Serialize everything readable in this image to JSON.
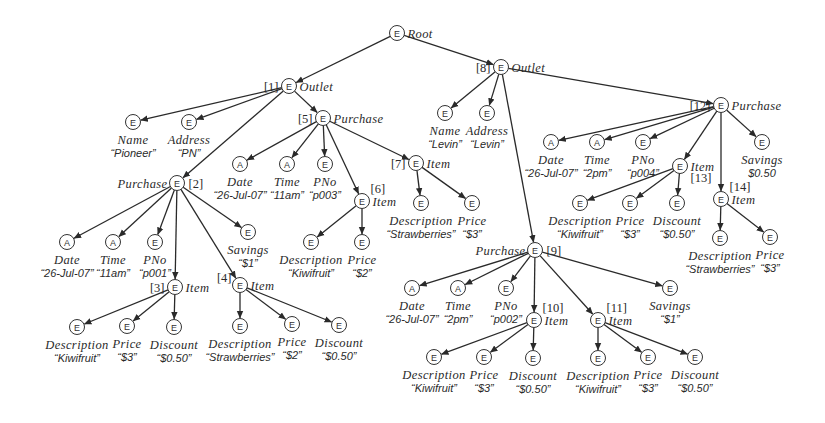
{
  "diagram": {
    "colors": {
      "ink": "#2a2a2a",
      "background": "#ffffff"
    },
    "node_types": {
      "E": "element",
      "A": "attribute"
    },
    "nodes": [
      {
        "key": "root",
        "type": "E",
        "x": 397,
        "y": 33,
        "label": "Root",
        "label_pos": "right"
      },
      {
        "key": "n1",
        "type": "E",
        "x": 289,
        "y": 86,
        "label": "Outlet",
        "label_pos": "right",
        "id": "[1]",
        "id_pos": "left"
      },
      {
        "key": "n1_name",
        "type": "E",
        "x": 133,
        "y": 122,
        "label": "Name",
        "value": "“Pioneer”",
        "label_pos": "below"
      },
      {
        "key": "n1_addr",
        "type": "E",
        "x": 189,
        "y": 122,
        "label": "Address",
        "value": "“PN”",
        "label_pos": "below"
      },
      {
        "key": "n2",
        "type": "E",
        "x": 177,
        "y": 183,
        "label": "Purchase",
        "label_pos": "left",
        "id": "[2]",
        "id_pos": "right"
      },
      {
        "key": "n2_date",
        "type": "A",
        "x": 67,
        "y": 242,
        "label": "Date",
        "value": "“26-Jul-07”",
        "label_pos": "below"
      },
      {
        "key": "n2_time",
        "type": "A",
        "x": 113,
        "y": 242,
        "label": "Time",
        "value": "“11am”",
        "label_pos": "below"
      },
      {
        "key": "n2_pno",
        "type": "E",
        "x": 155,
        "y": 242,
        "label": "PNo",
        "value": "“p001”",
        "label_pos": "below"
      },
      {
        "key": "n2_sav",
        "type": "E",
        "x": 248,
        "y": 232,
        "label": "Savings",
        "value": "“$1”",
        "label_pos": "below"
      },
      {
        "key": "n3",
        "type": "E",
        "x": 175,
        "y": 287,
        "label": "Item",
        "label_pos": "right",
        "id": "[3]",
        "id_pos": "left"
      },
      {
        "key": "n3_desc",
        "type": "E",
        "x": 77,
        "y": 327,
        "label": "Description",
        "value": "“Kiwifruit”",
        "label_pos": "below"
      },
      {
        "key": "n3_price",
        "type": "E",
        "x": 127,
        "y": 326,
        "label": "Price",
        "value": "“$3”",
        "label_pos": "below"
      },
      {
        "key": "n3_disc",
        "type": "E",
        "x": 174,
        "y": 327,
        "label": "Discount",
        "value": "“$0.50”",
        "label_pos": "below"
      },
      {
        "key": "n4",
        "type": "E",
        "x": 240,
        "y": 285,
        "label": "Item",
        "label_pos": "right",
        "id": "[4]",
        "id_pos": "topleft"
      },
      {
        "key": "n4_desc",
        "type": "E",
        "x": 240,
        "y": 326,
        "label": "Description",
        "value": "“Strawberries”",
        "label_pos": "below"
      },
      {
        "key": "n4_price",
        "type": "E",
        "x": 292,
        "y": 324,
        "label": "Price",
        "value": "“$2”",
        "label_pos": "below"
      },
      {
        "key": "n4_disc",
        "type": "E",
        "x": 339,
        "y": 325,
        "label": "Discount",
        "value": "“$0.50”",
        "label_pos": "below"
      },
      {
        "key": "n5",
        "type": "E",
        "x": 323,
        "y": 118,
        "label": "Purchase",
        "label_pos": "right",
        "id": "[5]",
        "id_pos": "left"
      },
      {
        "key": "n5_date",
        "type": "A",
        "x": 240,
        "y": 164,
        "label": "Date",
        "value": "“26-Jul-07”",
        "label_pos": "below"
      },
      {
        "key": "n5_time",
        "type": "A",
        "x": 287,
        "y": 164,
        "label": "Time",
        "value": "“11am”",
        "label_pos": "below"
      },
      {
        "key": "n5_pno",
        "type": "E",
        "x": 325,
        "y": 164,
        "label": "PNo",
        "value": "“p003”",
        "label_pos": "below"
      },
      {
        "key": "n6",
        "type": "E",
        "x": 362,
        "y": 201,
        "label": "Item",
        "label_pos": "right",
        "id": "[6]",
        "id_pos": "topright"
      },
      {
        "key": "n6_desc",
        "type": "E",
        "x": 311,
        "y": 242,
        "label": "Description",
        "value": "“Kiwifruit”",
        "label_pos": "below"
      },
      {
        "key": "n6_price",
        "type": "E",
        "x": 362,
        "y": 242,
        "label": "Price",
        "value": "“$2”",
        "label_pos": "below"
      },
      {
        "key": "n7",
        "type": "E",
        "x": 416,
        "y": 163,
        "label": "Item",
        "label_pos": "right",
        "id": "[7]",
        "id_pos": "left"
      },
      {
        "key": "n7_desc",
        "type": "E",
        "x": 421,
        "y": 203,
        "label": "Description",
        "value": "“Strawberries”",
        "label_pos": "below"
      },
      {
        "key": "n7_price",
        "type": "E",
        "x": 472,
        "y": 203,
        "label": "Price",
        "value": "“$3”",
        "label_pos": "below"
      },
      {
        "key": "n8",
        "type": "E",
        "x": 501,
        "y": 67,
        "label": "Outlet",
        "label_pos": "right",
        "id": "[8]",
        "id_pos": "left"
      },
      {
        "key": "n8_name",
        "type": "E",
        "x": 445,
        "y": 113,
        "label": "Name",
        "value": "“Levin”",
        "label_pos": "below"
      },
      {
        "key": "n8_addr",
        "type": "E",
        "x": 487,
        "y": 113,
        "label": "Address",
        "value": "“Levin”",
        "label_pos": "below"
      },
      {
        "key": "n9",
        "type": "E",
        "x": 535,
        "y": 250,
        "label": "Purchase",
        "label_pos": "left",
        "id": "[9]",
        "id_pos": "right"
      },
      {
        "key": "n9_date",
        "type": "A",
        "x": 412,
        "y": 288,
        "label": "Date",
        "value": "“26-Jul-07”",
        "label_pos": "below"
      },
      {
        "key": "n9_time",
        "type": "A",
        "x": 458,
        "y": 288,
        "label": "Time",
        "value": "“2pm”",
        "label_pos": "below"
      },
      {
        "key": "n9_pno",
        "type": "E",
        "x": 506,
        "y": 288,
        "label": "PNo",
        "value": "“p002”",
        "label_pos": "below"
      },
      {
        "key": "n9_sav",
        "type": "E",
        "x": 670,
        "y": 288,
        "label": "Savings",
        "value": "“$1”",
        "label_pos": "below"
      },
      {
        "key": "n10",
        "type": "E",
        "x": 534,
        "y": 320,
        "label": "Item",
        "label_pos": "right",
        "id": "[10]",
        "id_pos": "topright"
      },
      {
        "key": "n10_desc",
        "type": "E",
        "x": 434,
        "y": 357,
        "label": "Description",
        "value": "“Kiwifruit”",
        "label_pos": "below"
      },
      {
        "key": "n10_price",
        "type": "E",
        "x": 484,
        "y": 357,
        "label": "Price",
        "value": "“$3”",
        "label_pos": "below"
      },
      {
        "key": "n10_disc",
        "type": "E",
        "x": 533,
        "y": 358,
        "label": "Discount",
        "value": "“$0.50”",
        "label_pos": "below"
      },
      {
        "key": "n11",
        "type": "E",
        "x": 598,
        "y": 320,
        "label": "Item",
        "label_pos": "right",
        "id": "[11]",
        "id_pos": "topright"
      },
      {
        "key": "n11_desc",
        "type": "E",
        "x": 598,
        "y": 358,
        "label": "Description",
        "value": "“Kiwifruit”",
        "label_pos": "below"
      },
      {
        "key": "n11_price",
        "type": "E",
        "x": 648,
        "y": 357,
        "label": "Price",
        "value": "“$3”",
        "label_pos": "below"
      },
      {
        "key": "n11_disc",
        "type": "E",
        "x": 695,
        "y": 357,
        "label": "Discount",
        "value": "“$0.50”",
        "label_pos": "below"
      },
      {
        "key": "n12",
        "type": "E",
        "x": 721,
        "y": 105,
        "label": "Purchase",
        "label_pos": "right",
        "id": "[12]",
        "id_pos": "left"
      },
      {
        "key": "n12_date",
        "type": "A",
        "x": 551,
        "y": 142,
        "label": "Date",
        "value": "“26-Jul-07”",
        "label_pos": "below"
      },
      {
        "key": "n12_time",
        "type": "A",
        "x": 597,
        "y": 142,
        "label": "Time",
        "value": "“2pm”",
        "label_pos": "below"
      },
      {
        "key": "n12_pno",
        "type": "E",
        "x": 643,
        "y": 142,
        "label": "PNo",
        "value": "“p004”",
        "label_pos": "below"
      },
      {
        "key": "n12_sav",
        "type": "E",
        "x": 762,
        "y": 142,
        "label": "Savings",
        "value": "$0.50",
        "label_pos": "below"
      },
      {
        "key": "n13",
        "type": "E",
        "x": 680,
        "y": 166,
        "label": "Item",
        "label_pos": "right",
        "id": "[13]",
        "id_pos": "bottomright"
      },
      {
        "key": "n13_desc",
        "type": "E",
        "x": 580,
        "y": 203,
        "label": "Description",
        "value": "“Kiwifruit”",
        "label_pos": "below"
      },
      {
        "key": "n13_price",
        "type": "E",
        "x": 630,
        "y": 203,
        "label": "Price",
        "value": "“$3”",
        "label_pos": "below"
      },
      {
        "key": "n13_disc",
        "type": "E",
        "x": 677,
        "y": 203,
        "label": "Discount",
        "value": "“$0.50”",
        "label_pos": "below"
      },
      {
        "key": "n14",
        "type": "E",
        "x": 721,
        "y": 199,
        "label": "Item",
        "label_pos": "right",
        "id": "[14]",
        "id_pos": "topright"
      },
      {
        "key": "n14_desc",
        "type": "E",
        "x": 720,
        "y": 238,
        "label": "Description",
        "value": "“Strawberries”",
        "label_pos": "below"
      },
      {
        "key": "n14_price",
        "type": "E",
        "x": 770,
        "y": 237,
        "label": "Price",
        "value": "“$3”",
        "label_pos": "below"
      }
    ],
    "edges": [
      [
        "root",
        "n1"
      ],
      [
        "root",
        "n8"
      ],
      [
        "n1",
        "n1_name"
      ],
      [
        "n1",
        "n1_addr"
      ],
      [
        "n1",
        "n2"
      ],
      [
        "n1",
        "n5"
      ],
      [
        "n2",
        "n2_date"
      ],
      [
        "n2",
        "n2_time"
      ],
      [
        "n2",
        "n2_pno"
      ],
      [
        "n2",
        "n3"
      ],
      [
        "n2",
        "n4"
      ],
      [
        "n2",
        "n2_sav"
      ],
      [
        "n3",
        "n3_desc"
      ],
      [
        "n3",
        "n3_price"
      ],
      [
        "n3",
        "n3_disc"
      ],
      [
        "n4",
        "n4_desc"
      ],
      [
        "n4",
        "n4_price"
      ],
      [
        "n4",
        "n4_disc"
      ],
      [
        "n5",
        "n5_date"
      ],
      [
        "n5",
        "n5_time"
      ],
      [
        "n5",
        "n5_pno"
      ],
      [
        "n5",
        "n6"
      ],
      [
        "n5",
        "n7"
      ],
      [
        "n6",
        "n6_desc"
      ],
      [
        "n6",
        "n6_price"
      ],
      [
        "n7",
        "n7_desc"
      ],
      [
        "n7",
        "n7_price"
      ],
      [
        "n8",
        "n8_name"
      ],
      [
        "n8",
        "n8_addr"
      ],
      [
        "n8",
        "n9"
      ],
      [
        "n8",
        "n12"
      ],
      [
        "n9",
        "n9_date"
      ],
      [
        "n9",
        "n9_time"
      ],
      [
        "n9",
        "n9_pno"
      ],
      [
        "n9",
        "n10"
      ],
      [
        "n9",
        "n11"
      ],
      [
        "n9",
        "n9_sav"
      ],
      [
        "n10",
        "n10_desc"
      ],
      [
        "n10",
        "n10_price"
      ],
      [
        "n10",
        "n10_disc"
      ],
      [
        "n11",
        "n11_desc"
      ],
      [
        "n11",
        "n11_price"
      ],
      [
        "n11",
        "n11_disc"
      ],
      [
        "n12",
        "n12_date"
      ],
      [
        "n12",
        "n12_time"
      ],
      [
        "n12",
        "n12_pno"
      ],
      [
        "n12",
        "n13"
      ],
      [
        "n12",
        "n14"
      ],
      [
        "n12",
        "n12_sav"
      ],
      [
        "n13",
        "n13_desc"
      ],
      [
        "n13",
        "n13_price"
      ],
      [
        "n13",
        "n13_disc"
      ],
      [
        "n14",
        "n14_desc"
      ],
      [
        "n14",
        "n14_price"
      ]
    ]
  }
}
